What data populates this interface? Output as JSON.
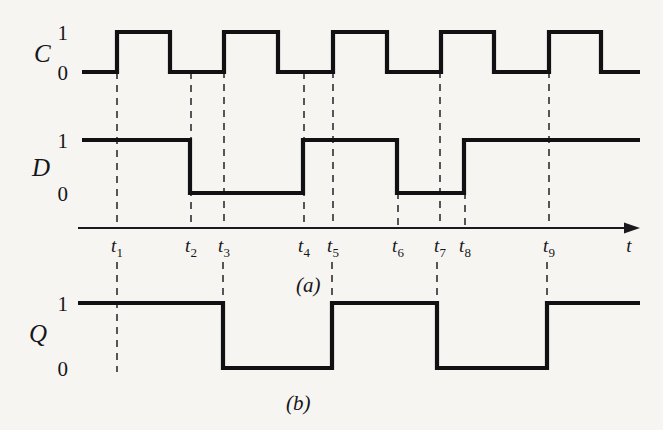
{
  "figure": {
    "title_panels": [
      {
        "key": "a",
        "label": "(a)",
        "x": 296,
        "y": 292
      },
      {
        "key": "b",
        "label": "(b)",
        "x": 286,
        "y": 410
      }
    ],
    "background_color": "#f6f5f1",
    "ink_color": "#111114",
    "marker_color": "#3a3a40"
  },
  "axis": {
    "label": "t",
    "label_x": 629,
    "label_y": 252,
    "y": 228,
    "x_start": 78,
    "x_end": 640,
    "arrow": true,
    "ticks": [
      {
        "name": "t1",
        "label": "t",
        "sub": "1",
        "x": 117
      },
      {
        "name": "t2",
        "label": "t",
        "sub": "2",
        "x": 191
      },
      {
        "name": "t3",
        "label": "t",
        "sub": "3",
        "x": 224
      },
      {
        "name": "t4",
        "label": "t",
        "sub": "4",
        "x": 304
      },
      {
        "name": "t5",
        "label": "t",
        "sub": "5",
        "x": 333
      },
      {
        "name": "t6",
        "label": "t",
        "sub": "6",
        "x": 398
      },
      {
        "name": "t7",
        "label": "t",
        "sub": "7",
        "x": 440
      },
      {
        "name": "t8",
        "label": "t",
        "sub": "8",
        "x": 465
      },
      {
        "name": "t9",
        "label": "t",
        "sub": "9",
        "x": 549
      }
    ],
    "tick_label_y": 252
  },
  "signals": [
    {
      "name": "C",
      "name_x": 34,
      "name_y": 62,
      "level_high_y": 32,
      "level_low_y": 72,
      "level_labels": {
        "high": "1",
        "low": "0",
        "label_x": 68,
        "high_y": 40,
        "low_y": 80
      },
      "x_start": 82,
      "x_end": 640,
      "initial": 0,
      "transitions": [
        {
          "x": 117,
          "to": 1
        },
        {
          "x": 170,
          "to": 0
        },
        {
          "x": 224,
          "to": 1
        },
        {
          "x": 278,
          "to": 0
        },
        {
          "x": 333,
          "to": 1
        },
        {
          "x": 387,
          "to": 0
        },
        {
          "x": 441,
          "to": 1
        },
        {
          "x": 494,
          "to": 0
        },
        {
          "x": 549,
          "to": 1
        },
        {
          "x": 601,
          "to": 0
        }
      ]
    },
    {
      "name": "D",
      "name_x": 32,
      "name_y": 176,
      "level_high_y": 140,
      "level_low_y": 193,
      "level_labels": {
        "high": "1",
        "low": "0",
        "label_x": 68,
        "high_y": 148,
        "low_y": 201
      },
      "x_start": 82,
      "x_end": 640,
      "initial": 1,
      "transitions": [
        {
          "x": 190,
          "to": 0
        },
        {
          "x": 303,
          "to": 1
        },
        {
          "x": 397,
          "to": 0
        },
        {
          "x": 464,
          "to": 1
        }
      ]
    },
    {
      "name": "Q",
      "name_x": 29,
      "name_y": 342,
      "level_high_y": 303,
      "level_low_y": 368,
      "level_labels": {
        "high": "1",
        "low": "0",
        "label_x": 68,
        "high_y": 311,
        "low_y": 376
      },
      "x_start": 78,
      "x_end": 640,
      "initial": 1,
      "transitions": [
        {
          "x": 223,
          "to": 0
        },
        {
          "x": 332,
          "to": 1
        },
        {
          "x": 437,
          "to": 0
        },
        {
          "x": 547,
          "to": 1
        }
      ]
    }
  ],
  "markers": [
    {
      "name": "marker-t1-upper",
      "x": 117,
      "y1": 72,
      "y2": 228
    },
    {
      "name": "marker-t2-upper",
      "x": 191,
      "y1": 72,
      "y2": 228
    },
    {
      "name": "marker-t3-upper",
      "x": 224,
      "y1": 32,
      "y2": 228
    },
    {
      "name": "marker-t4-upper",
      "x": 304,
      "y1": 72,
      "y2": 228
    },
    {
      "name": "marker-t5-upper",
      "x": 333,
      "y1": 32,
      "y2": 228
    },
    {
      "name": "marker-t6-upper",
      "x": 398,
      "y1": 140,
      "y2": 228
    },
    {
      "name": "marker-t7-upper",
      "x": 440,
      "y1": 32,
      "y2": 228
    },
    {
      "name": "marker-t8-upper",
      "x": 465,
      "y1": 140,
      "y2": 228
    },
    {
      "name": "marker-t9-upper",
      "x": 549,
      "y1": 32,
      "y2": 228
    },
    {
      "name": "marker-t1-lower",
      "x": 117,
      "y1": 262,
      "y2": 372
    },
    {
      "name": "marker-t3-lower",
      "x": 223,
      "y1": 262,
      "y2": 306
    },
    {
      "name": "marker-t5-lower",
      "x": 332,
      "y1": 262,
      "y2": 306
    },
    {
      "name": "marker-t7-lower",
      "x": 437,
      "y1": 262,
      "y2": 306
    },
    {
      "name": "marker-t9-lower",
      "x": 547,
      "y1": 262,
      "y2": 306
    }
  ],
  "chart_data": {
    "type": "line",
    "xlabel": "t",
    "ylabel": "",
    "subplots": [
      "(a)",
      "(b)"
    ],
    "categories": [
      "t1",
      "t2",
      "t3",
      "t4",
      "t5",
      "t6",
      "t7",
      "t8",
      "t9"
    ],
    "series": [
      {
        "name": "C",
        "panel": "(a)",
        "description": "Clock: square wave, five pulses; rising edges at t1, t3, t5, t7, t9",
        "initial_value": 0,
        "levels": [
          0,
          1,
          0,
          1,
          0,
          1,
          0,
          1,
          0,
          1,
          0
        ],
        "edge_times": [
          "t1",
          "",
          "t3",
          "",
          "t5",
          "",
          "t7",
          "",
          "t9",
          ""
        ]
      },
      {
        "name": "D",
        "panel": "(a)",
        "description": "Data input: high initially, falls before t2, rises at t4, falls at t6, rises at t8",
        "initial_value": 1,
        "levels": [
          1,
          0,
          1,
          0,
          1
        ],
        "edge_times": [
          "t2",
          "t4",
          "t6",
          "t8"
        ]
      },
      {
        "name": "Q",
        "panel": "(b)",
        "description": "Output: follows D at clock rising edges; falls at t3, rises at t5, falls at t7, rises at t9",
        "initial_value": 1,
        "levels": [
          1,
          0,
          1,
          0,
          1
        ],
        "edge_times": [
          "t3",
          "t5",
          "t7",
          "t9"
        ]
      }
    ],
    "ylim": [
      0,
      1
    ],
    "grid": false,
    "legend": "none"
  }
}
